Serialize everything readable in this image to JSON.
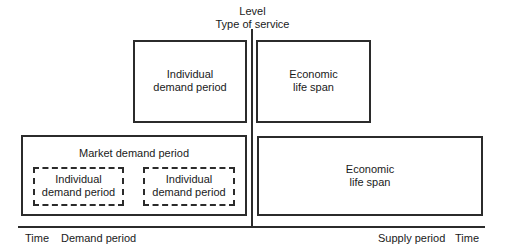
{
  "diagram": {
    "vertical_axis": {
      "title_line1": "Level",
      "title_line2": "Type of service"
    },
    "horizontal_axis": {
      "left_labels": [
        "Time",
        "Demand period"
      ],
      "right_labels": [
        "Supply period",
        "Time"
      ]
    },
    "boxes": {
      "top_left": {
        "line1": "Individual",
        "line2": "demand period"
      },
      "top_right": {
        "line1": "Economic",
        "line2": "life span"
      },
      "bottom_left": {
        "title": "Market demand period",
        "inner": [
          {
            "line1": "Individual",
            "line2": "demand period"
          },
          {
            "line1": "Individual",
            "line2": "demand period"
          }
        ]
      },
      "bottom_right": {
        "line1": "Economic",
        "line2": "life span"
      }
    },
    "colors": {
      "line": "#2b2b2b",
      "background": "#ffffff",
      "text": "#1a1a1a"
    }
  }
}
